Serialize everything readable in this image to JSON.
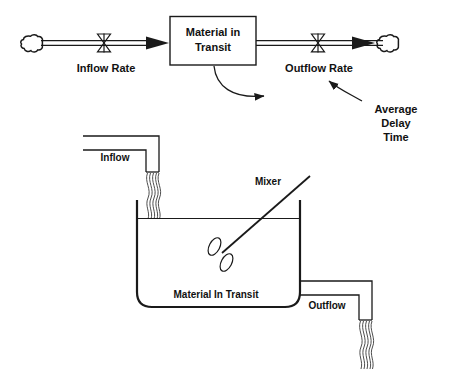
{
  "diagram": {
    "colors": {
      "ink": "#1a1a1a",
      "background": "#ffffff",
      "text": "#111111"
    },
    "stock_flow": {
      "stock_box": {
        "label_line1": "Material in",
        "label_line2": "Transit",
        "name": "Material in Transit"
      },
      "inflow": {
        "rate_label": "Inflow Rate",
        "source_icon": "cloud-icon",
        "valve_icon": "valve-icon"
      },
      "outflow": {
        "rate_label": "Outflow Rate",
        "sink_icon": "cloud-icon",
        "valve_icon": "valve-icon"
      },
      "average_delay": {
        "label_line1": "Average",
        "label_line2": "Delay",
        "label_line3": "Time"
      }
    },
    "tank": {
      "contents_label": "Material In Transit",
      "inflow_label": "Inflow",
      "outflow_label": "Outflow",
      "mixer_label": "Mixer"
    }
  }
}
